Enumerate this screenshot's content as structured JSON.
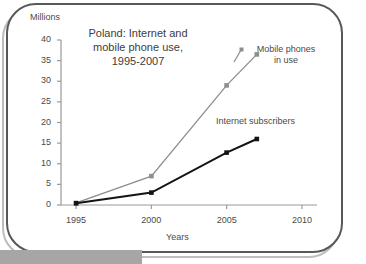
{
  "figure": {
    "title_lines": [
      "Poland: Internet and",
      "mobile phone use,",
      "1995-2007"
    ],
    "frame_color": "#58585a",
    "background": "#ffffff"
  },
  "chart_data": {
    "type": "line",
    "title": "Poland: Internet and mobile phone use, 1995-2007",
    "xlabel": "Years",
    "ylabel": "Millions",
    "xlim": [
      1994,
      2011
    ],
    "ylim": [
      0,
      40
    ],
    "ytick_labels": [
      "0",
      "5",
      "10",
      "15",
      "20",
      "25",
      "30",
      "35",
      "40"
    ],
    "ytick_values": [
      0,
      5,
      10,
      15,
      20,
      25,
      30,
      35,
      40
    ],
    "xtick_labels": [
      "1995",
      "2000",
      "2005",
      "2010"
    ],
    "xtick_values": [
      1995,
      2000,
      2005,
      2010
    ],
    "grid": false,
    "legend_position": "inline-annotation",
    "series": [
      {
        "name": "Mobile phones in use",
        "label_lines": [
          "Mobile phones",
          "in use"
        ],
        "color": "#8e8e8e",
        "marker": "square",
        "x": [
          1995,
          2000,
          2005,
          2007
        ],
        "values": [
          0.5,
          7.0,
          29.0,
          36.5
        ]
      },
      {
        "name": "Internet subscribers",
        "label_lines": [
          "Internet subscribers"
        ],
        "color": "#141414",
        "marker": "square",
        "x": [
          1995,
          2000,
          2005,
          2007
        ],
        "values": [
          0.4,
          3.0,
          12.7,
          16.0
        ]
      }
    ]
  }
}
